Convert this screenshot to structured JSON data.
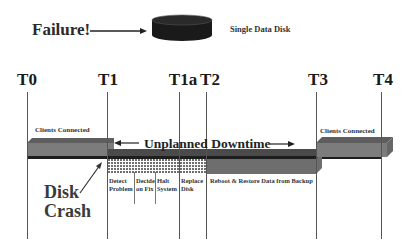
{
  "header": {
    "failure_label": "Failure!",
    "disk_label": "Single Data Disk",
    "disk_icon": "disk-cylinder-icon",
    "arrow_icon": "arrow-right-icon"
  },
  "timeline": {
    "markers": [
      {
        "label": "T0",
        "x": 27
      },
      {
        "label": "T1",
        "x": 107
      },
      {
        "label": "T1a",
        "x": 179
      },
      {
        "label": "T2",
        "x": 206
      },
      {
        "label": "T3",
        "x": 316
      },
      {
        "label": "T4",
        "x": 381
      }
    ],
    "clients_connected_left": "Clients Connected",
    "clients_connected_right": "Clients Connected",
    "downtime_label": "Unplanned Downtime",
    "downtime_arrow_left": "arrow-left-icon",
    "downtime_arrow_right": "arrow-right-icon",
    "steps": [
      {
        "line1": "Detect",
        "line2": "Problem"
      },
      {
        "line1": "Decide",
        "line2": "on Fix"
      },
      {
        "line1": "Halt",
        "line2": "System"
      },
      {
        "line1": "Replace",
        "line2": "Disk"
      }
    ],
    "restore_label": "Reboot & Restore Data from Backup",
    "disk_crash_line1": "Disk",
    "disk_crash_line2": "Crash"
  },
  "colors": {
    "bar_gray": "#7a7a7a",
    "bar_dark": "#4a4a4a",
    "baseline": "#1e1e1e",
    "pattern_dot": "#777777"
  }
}
